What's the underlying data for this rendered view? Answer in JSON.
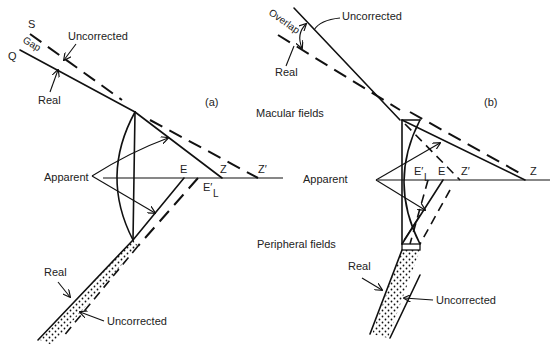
{
  "panels": [
    {
      "id": "a",
      "label": "(a)",
      "ray_labels": {
        "S": "S",
        "Q": "Q",
        "gap": "Gap"
      },
      "upper_labels": {
        "uncorrected": "Uncorrected",
        "real": "Real"
      },
      "axis_points": {
        "E": "E",
        "Z": "Z",
        "Z_prime": "Z′",
        "E_prime_L": "E′",
        "sub_L": "L"
      },
      "apparent": "Apparent",
      "lower_labels": {
        "real": "Real",
        "uncorrected": "Uncorrected"
      }
    },
    {
      "id": "b",
      "label": "(b)",
      "upper_labels": {
        "overlap": "Overlap",
        "uncorrected": "Uncorrected",
        "real": "Real"
      },
      "axis_points": {
        "E": "E",
        "Z": "Z",
        "Z_prime": "Z′",
        "E_prime_L": "E′",
        "sub_L": "L"
      },
      "apparent": "Apparent",
      "lower_labels": {
        "real": "Real",
        "uncorrected": "Uncorrected"
      }
    }
  ],
  "region_labels": {
    "macular": "Macular fields",
    "peripheral": "Peripheral fields"
  }
}
